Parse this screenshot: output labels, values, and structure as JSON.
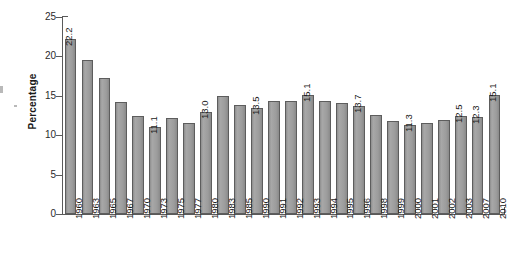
{
  "chart_data": {
    "type": "bar",
    "title": "",
    "subtitle": "",
    "xlabel": "",
    "ylabel": "Percentage",
    "ylim": [
      0,
      25
    ],
    "yticks": [
      0,
      5,
      10,
      15,
      20,
      25
    ],
    "ytick_labels": [
      "0",
      "5",
      "10",
      "15",
      "20",
      "25"
    ],
    "grid": false,
    "legend": null,
    "bar_color": "#9c9c9c",
    "bar_edge_color": "#5d5d5d",
    "axis_color": "#5a5a5a",
    "text_color": "#1a1a1a",
    "background": "#ffffff",
    "categories": [
      "1960",
      "1963",
      "1965",
      "1967",
      "1970",
      "1973",
      "1975",
      "1977",
      "1980",
      "1983",
      "1985",
      "1990",
      "1991",
      "1992",
      "1993",
      "1994",
      "1995",
      "1996",
      "1998",
      "1999",
      "2000",
      "2001",
      "2002",
      "2003",
      "2007",
      "2010"
    ],
    "values": [
      22.2,
      19.5,
      17.3,
      14.2,
      12.5,
      11.1,
      12.2,
      11.6,
      13.0,
      15.0,
      13.9,
      13.5,
      14.3,
      14.3,
      15.1,
      14.4,
      14.1,
      13.7,
      12.6,
      11.8,
      11.3,
      11.6,
      11.9,
      12.5,
      12.3,
      15.1
    ],
    "annotations": [
      {
        "category": "1960",
        "value": 22.2,
        "text": "22.2"
      },
      {
        "category": "1973",
        "value": 11.1,
        "text": "11.1"
      },
      {
        "category": "1980",
        "value": 13.0,
        "text": "13.0"
      },
      {
        "category": "1990",
        "value": 13.5,
        "text": "13.5"
      },
      {
        "category": "1993",
        "value": 15.1,
        "text": "15.1"
      },
      {
        "category": "1996",
        "value": 13.7,
        "text": "13.7"
      },
      {
        "category": "2000",
        "value": 11.3,
        "text": "11.3"
      },
      {
        "category": "2003",
        "value": 12.5,
        "text": "12.5"
      },
      {
        "category": "2007",
        "value": 12.3,
        "text": "12.3"
      },
      {
        "category": "2010",
        "value": 15.1,
        "text": "15.1"
      }
    ]
  }
}
